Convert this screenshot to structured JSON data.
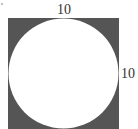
{
  "figure": {
    "type": "square-with-inscribed-circle",
    "square_fill": "#555555",
    "circle_fill": "#ffffff",
    "labels": {
      "top_side": "10",
      "right_side": "10"
    }
  }
}
